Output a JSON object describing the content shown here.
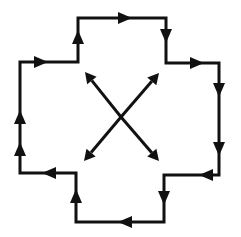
{
  "diagram": {
    "title": "",
    "background": "#ffffff",
    "stroke_color": "#111111",
    "outline": {
      "shape": "stepped-cross-cycle",
      "direction": "clockwise",
      "points": [
        [
          20,
          62
        ],
        [
          78,
          62
        ],
        [
          78,
          18
        ],
        [
          166,
          18
        ],
        [
          166,
          63
        ],
        [
          219,
          63
        ],
        [
          219,
          175
        ],
        [
          164,
          175
        ],
        [
          164,
          222
        ],
        [
          76,
          222
        ],
        [
          76,
          173
        ],
        [
          20,
          173
        ]
      ]
    },
    "edge_arrows": [
      {
        "x": 20,
        "y": 118,
        "dir": "up"
      },
      {
        "x": 20,
        "y": 150,
        "dir": "up"
      },
      {
        "x": 40,
        "y": 62,
        "dir": "right"
      },
      {
        "x": 78,
        "y": 38,
        "dir": "up"
      },
      {
        "x": 124,
        "y": 18,
        "dir": "right"
      },
      {
        "x": 166,
        "y": 35,
        "dir": "down"
      },
      {
        "x": 196,
        "y": 63,
        "dir": "right"
      },
      {
        "x": 219,
        "y": 89,
        "dir": "down"
      },
      {
        "x": 219,
        "y": 148,
        "dir": "down"
      },
      {
        "x": 207,
        "y": 175,
        "dir": "left"
      },
      {
        "x": 164,
        "y": 197,
        "dir": "down"
      },
      {
        "x": 126,
        "y": 222,
        "dir": "left"
      },
      {
        "x": 76,
        "y": 197,
        "dir": "up"
      },
      {
        "x": 50,
        "y": 173,
        "dir": "left"
      }
    ],
    "center_cross": {
      "center": [
        121,
        117
      ],
      "arrows": [
        {
          "name": "up-left",
          "tip": [
            85,
            72
          ]
        },
        {
          "name": "up-right",
          "tip": [
            159,
            73
          ]
        },
        {
          "name": "down-left",
          "tip": [
            84,
            161
          ]
        },
        {
          "name": "down-right",
          "tip": [
            159,
            161
          ]
        }
      ]
    }
  }
}
